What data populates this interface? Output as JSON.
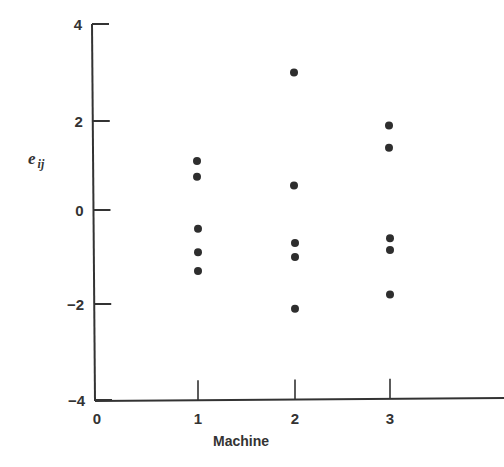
{
  "chart_data": {
    "type": "scatter",
    "title": "",
    "xlabel": "Machine",
    "ylabel": "e_ij",
    "ylabel_main": "e",
    "ylabel_sub": "ij",
    "xlim": [
      0,
      4
    ],
    "ylim": [
      -4,
      4
    ],
    "x_ticks": [
      0,
      1,
      2,
      3
    ],
    "x_tick_labels": [
      "0",
      "1",
      "2",
      "3"
    ],
    "y_ticks": [
      4,
      2,
      0,
      -2,
      -4
    ],
    "y_tick_labels": [
      "4",
      "2",
      "0",
      "−2",
      "−4"
    ],
    "grid": false,
    "legend": null,
    "series": [
      {
        "name": "Machine 1",
        "x": 1,
        "values": [
          1.1,
          0.75,
          -0.4,
          -0.9,
          -1.3
        ]
      },
      {
        "name": "Machine 2",
        "x": 2,
        "values": [
          3.0,
          0.55,
          -0.7,
          -1.0,
          -2.1
        ]
      },
      {
        "name": "Machine 3",
        "x": 3,
        "values": [
          1.9,
          1.4,
          -0.6,
          -0.85,
          -1.8
        ]
      }
    ]
  }
}
